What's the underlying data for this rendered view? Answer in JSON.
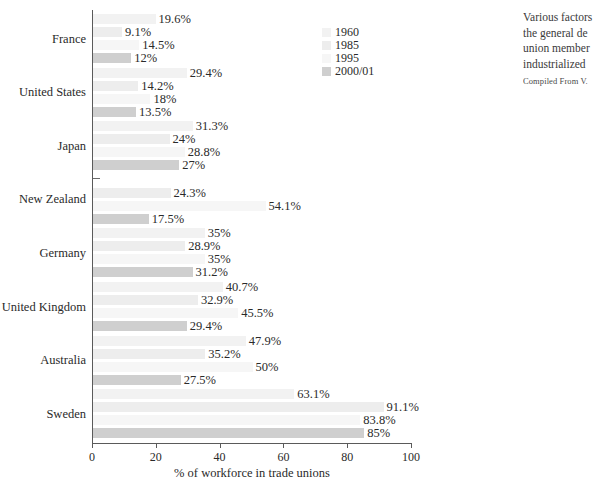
{
  "chart_data": {
    "type": "bar",
    "orientation": "horizontal",
    "title": "",
    "xlabel": "% of workforce in trade unions",
    "ylabel": "",
    "xlim": [
      0,
      100
    ],
    "xticks": [
      0,
      20,
      40,
      60,
      80,
      100
    ],
    "xtick_labels": [
      "0",
      "20",
      "40",
      "60",
      "80",
      "100"
    ],
    "grid": false,
    "legend_position": "top-right",
    "categories": [
      "France",
      "United States",
      "Japan",
      "New Zealand",
      "Germany",
      "United Kingdom",
      "Australia",
      "Sweden"
    ],
    "series": [
      {
        "name": "1960",
        "color": "#f2f2f2",
        "values": [
          19.6,
          29.4,
          31.3,
          null,
          35,
          40.7,
          47.9,
          63.1
        ],
        "labels": [
          "19.6%",
          "29.4%",
          "31.3%",
          "–",
          "35%",
          "40.7%",
          "47.9%",
          "63.1%"
        ]
      },
      {
        "name": "1985",
        "color": "#ededed",
        "values": [
          9.1,
          14.2,
          24,
          24.3,
          28.9,
          32.9,
          35.2,
          91.1
        ],
        "labels": [
          "9.1%",
          "14.2%",
          "24%",
          "24.3%",
          "28.9%",
          "32.9%",
          "35.2%",
          "91.1%"
        ]
      },
      {
        "name": "1995",
        "color": "#f6f6f6",
        "values": [
          14.5,
          18,
          28.8,
          54.1,
          35,
          45.5,
          50,
          83.8
        ],
        "labels": [
          "14.5%",
          "18%",
          "28.8%",
          "54.1%",
          "35%",
          "45.5%",
          "50%",
          "83.8%"
        ]
      },
      {
        "name": "2000/01",
        "color": "#cfcfcf",
        "values": [
          12,
          13.5,
          27,
          17.5,
          31.2,
          29.4,
          27.5,
          85
        ],
        "labels": [
          "12%",
          "13.5%",
          "27%",
          "17.5%",
          "31.2%",
          "29.4%",
          "27.5%",
          "85%"
        ]
      }
    ]
  },
  "legend": {
    "entries": [
      {
        "label": "1960",
        "color": "#f2f2f2"
      },
      {
        "label": "1985",
        "color": "#ededed"
      },
      {
        "label": "1995",
        "color": "#f6f6f6"
      },
      {
        "label": "2000/01",
        "color": "#cfcfcf"
      }
    ]
  },
  "caption": {
    "lines": [
      "Various factors",
      "the general de",
      "union member",
      "industrialized "
    ],
    "source": "Compiled From V."
  }
}
